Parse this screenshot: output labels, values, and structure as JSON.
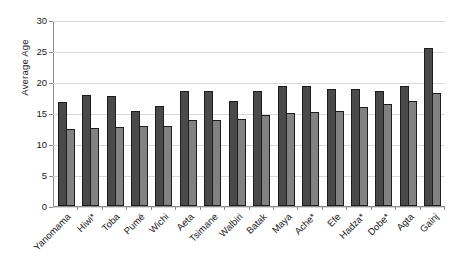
{
  "chart_data": {
    "type": "bar",
    "title": "",
    "xlabel": "",
    "ylabel": "Average Age",
    "ylim": [
      0,
      30
    ],
    "yticks": [
      0,
      5,
      10,
      15,
      20,
      25,
      30
    ],
    "grid": true,
    "legend": "none",
    "categories": [
      "Yanomama",
      "Hiwi*",
      "Toba",
      "Pumé",
      "Wichi",
      "Aeta",
      "Tsimane",
      "Walbiri",
      "Batak",
      "Maya",
      "Ache*",
      "Efe",
      "Hadza*",
      "Dobe*",
      "Agta",
      "Gainj"
    ],
    "series": [
      {
        "name": "Series 1",
        "color": "#4a4a4a",
        "values": [
          16.8,
          17.9,
          17.7,
          15.4,
          16.1,
          18.6,
          18.5,
          16.9,
          18.6,
          19.4,
          19.4,
          18.9,
          18.8,
          18.6,
          19.3,
          25.5
        ]
      },
      {
        "name": "Series 2",
        "color": "#828282",
        "values": [
          12.4,
          12.6,
          12.8,
          12.9,
          12.9,
          13.8,
          13.9,
          14.0,
          14.6,
          15.0,
          15.2,
          15.4,
          15.9,
          16.4,
          16.9,
          18.2
        ]
      }
    ]
  }
}
